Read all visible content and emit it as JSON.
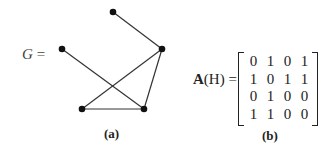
{
  "panel_a": {
    "label_var": "G",
    "label_eq": "=",
    "caption": "(a)",
    "nodes": [
      {
        "id": "top",
        "x": 113,
        "y": 12
      },
      {
        "id": "left",
        "x": 62,
        "y": 49
      },
      {
        "id": "right",
        "x": 162,
        "y": 49
      },
      {
        "id": "bottom-left",
        "x": 82,
        "y": 109
      },
      {
        "id": "bottom-right",
        "x": 144,
        "y": 109
      }
    ],
    "edges": [
      [
        "top",
        "right"
      ],
      [
        "left",
        "bottom-right"
      ],
      [
        "right",
        "bottom-left"
      ],
      [
        "right",
        "bottom-right"
      ],
      [
        "bottom-left",
        "bottom-right"
      ]
    ]
  },
  "panel_b": {
    "label_bold": "A",
    "label_rest": "(H) =",
    "caption": "(b)",
    "matrix": [
      [
        "0",
        "1",
        "0",
        "1"
      ],
      [
        "1",
        "0",
        "1",
        "1"
      ],
      [
        "0",
        "1",
        "0",
        "0"
      ],
      [
        "1",
        "1",
        "0",
        "0"
      ]
    ]
  }
}
